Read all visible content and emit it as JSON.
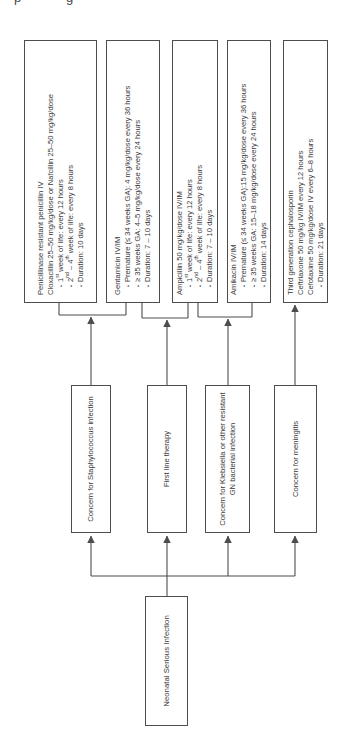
{
  "artifact": {
    "glyph1": "p",
    "glyph2": "g"
  },
  "chars": {
    "bullet": "•"
  },
  "colors": {
    "background": "#ffffff",
    "border": "#4d4d4d",
    "line": "#4d4d4d",
    "text": "#3a3a3a"
  },
  "root": {
    "label": "Neonatal Serious Infection"
  },
  "branches": [
    {
      "label": "Concern for Staphylococcus infection"
    },
    {
      "label": "First line therapy"
    },
    {
      "label": "Concern for Klebsiella or other resistant GN bacterial infection"
    },
    {
      "label": "Concern for meningitis"
    }
  ],
  "treatments": [
    {
      "lines": [
        {
          "text": "Penicillinase resistant penicillin IV",
          "bullet": false
        },
        {
          "text": "Cloxacillin 25–50 mg/kg/dose or Nafcillin 25–50 mg/kg/dose",
          "bullet": false
        },
        {
          "text": "1st week of life: every 12 hours",
          "bullet": true
        },
        {
          "text": "2nd – 4th week of life: every 8 hours",
          "bullet": true
        },
        {
          "text": "Duration: 10 days",
          "bullet": true
        }
      ]
    },
    {
      "lines": [
        {
          "text": "Gentamicin IV/IM",
          "bullet": false
        },
        {
          "text": "Premature (≤ 34 weeks GA): 4 mg/kg/dose every 36 hours",
          "bullet": true
        },
        {
          "text": "≥ 35 weeks GA: 4–5 mg/kg/dose every 24 hours",
          "bullet": true
        },
        {
          "text": "Duration: 7 – 10 days",
          "bullet": true
        }
      ]
    },
    {
      "lines": [
        {
          "text": "Ampicillin 50 mg/kg/dose IV/IM",
          "bullet": false
        },
        {
          "text": "1st week of life: every 12 hours",
          "bullet": true
        },
        {
          "text": "2nd – 4th week of life: every 8 hours",
          "bullet": true
        },
        {
          "text": "Duration: 7 – 10 days",
          "bullet": true
        }
      ]
    },
    {
      "lines": [
        {
          "text": "Amikacin IV/IM",
          "bullet": false
        },
        {
          "text": "Premature (≤ 34 weeks GA):15 mg/kg/dose every 36 hours",
          "bullet": true
        },
        {
          "text": "≥ 35 weeks GA: 15–18 mg/kg/dose every 24 hours",
          "bullet": true
        },
        {
          "text": "Duration: 14 days",
          "bullet": true
        }
      ]
    },
    {
      "lines": [
        {
          "text": "Third generation cephalosporin",
          "bullet": false
        },
        {
          "text": "Ceftriaxone 50 mg/kg IV/IM every 12 hours",
          "bullet": false
        },
        {
          "text": "Cefotaxime 50 mg/kg/dose IV every 6–8 hours",
          "bullet": false
        },
        {
          "text": "Duration: 21 days",
          "bullet": true
        }
      ]
    }
  ]
}
